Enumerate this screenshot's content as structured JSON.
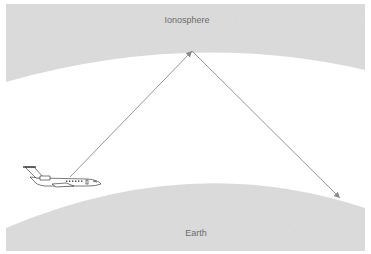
{
  "diagram": {
    "layers": {
      "ionosphere": {
        "label": "Ionosphere",
        "color": "#dcdcdc"
      },
      "earth": {
        "label": "Earth",
        "color": "#dcdcdc"
      }
    },
    "objects": {
      "aircraft": {
        "label": "Aircraft"
      }
    },
    "signal_path": {
      "color": "#8a8a8a",
      "segments": [
        {
          "from": "aircraft",
          "to": "ionosphere-reflection-point"
        },
        {
          "from": "ionosphere-reflection-point",
          "to": "earth-receiver-point"
        }
      ]
    }
  }
}
